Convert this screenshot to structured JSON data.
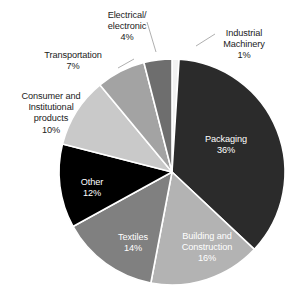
{
  "chart_data": {
    "type": "pie",
    "title": "",
    "subtitle": "",
    "xlabel": "",
    "ylabel": "",
    "legend_position": "none",
    "grid": false,
    "units": "percent",
    "start_angle_deg": 0,
    "direction": "clockwise",
    "categories": [
      "Industrial Machinery",
      "Packaging",
      "Building and Construction",
      "Textiles",
      "Other",
      "Consumer and Institutional products",
      "Transportation",
      "Electrical/electronic"
    ],
    "values": [
      1,
      36,
      16,
      14,
      12,
      10,
      7,
      4
    ],
    "total": 100,
    "slices": [
      {
        "name": "Industrial Machinery",
        "value": 1,
        "value_label": "1%",
        "label_line1": "Industrial",
        "label_line2": "Machinery",
        "label_line3": "1%",
        "color": "#f2f2f2",
        "label_placement": "outside",
        "label_text_color": "#1b1b1b",
        "leader_line": true
      },
      {
        "name": "Packaging",
        "value": 36,
        "value_label": "36%",
        "label_line1": "Packaging",
        "label_line2": "36%",
        "color": "#2b2b2b",
        "label_placement": "inside",
        "label_text_color": "#ffffff",
        "leader_line": false
      },
      {
        "name": "Building and Construction",
        "value": 16,
        "value_label": "16%",
        "label_line1": "Building and",
        "label_line2": "Construction",
        "label_line3": "16%",
        "color": "#b3b3b3",
        "label_placement": "inside",
        "label_text_color": "#ffffff",
        "leader_line": false
      },
      {
        "name": "Textiles",
        "value": 14,
        "value_label": "14%",
        "label_line1": "Textiles",
        "label_line2": "14%",
        "color": "#808080",
        "label_placement": "inside",
        "label_text_color": "#ffffff",
        "leader_line": false
      },
      {
        "name": "Other",
        "value": 12,
        "value_label": "12%",
        "label_line1": "Other",
        "label_line2": "12%",
        "color": "#000000",
        "label_placement": "inside",
        "label_text_color": "#ffffff",
        "leader_line": false
      },
      {
        "name": "Consumer and Institutional products",
        "value": 10,
        "value_label": "10%",
        "label_line1": "Consumer and",
        "label_line2": "Institutional",
        "label_line3": "products",
        "label_line4": "10%",
        "color": "#c9c9c9",
        "label_placement": "outside",
        "label_text_color": "#1b1b1b",
        "leader_line": false
      },
      {
        "name": "Transportation",
        "value": 7,
        "value_label": "7%",
        "label_line1": "Transportation",
        "label_line2": "7%",
        "color": "#a3a3a3",
        "label_placement": "outside",
        "label_text_color": "#1b1b1b",
        "leader_line": true
      },
      {
        "name": "Electrical/electronic",
        "value": 4,
        "value_label": "4%",
        "label_line1": "Electrical/",
        "label_line2": "electronic",
        "label_line3": "4%",
        "color": "#6e6e6e",
        "label_placement": "outside",
        "label_text_color": "#1b1b1b",
        "leader_line": true
      }
    ]
  },
  "labels": {
    "electrical": "Electrical/\nelectronic\n4%",
    "industrial": "Industrial\nMachinery\n1%",
    "transportation": "Transportation\n7%",
    "consumer": "Consumer and\nInstitutional\nproducts\n10%",
    "packaging_name": "Packaging",
    "packaging_value": "36%",
    "building_line1": "Building and",
    "building_line2": "Construction",
    "building_value": "16%",
    "textiles_name": "Textiles",
    "textiles_value": "14%",
    "other_name": "Other",
    "other_value": "12%"
  },
  "geometry": {
    "center_x": 172,
    "center_y": 172,
    "radius": 113
  }
}
